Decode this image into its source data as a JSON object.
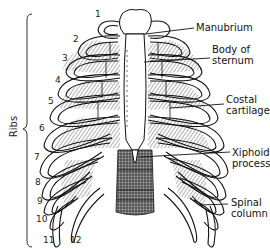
{
  "diagram": {
    "group_label": "Ribs",
    "rib_numbers": [
      "1",
      "2",
      "3",
      "4",
      "5",
      "6",
      "7",
      "8",
      "9",
      "10",
      "11",
      "12"
    ],
    "labels": {
      "manubrium": "Manubrium",
      "body_of_sternum_line1": "Body of",
      "body_of_sternum_line2": "sternum",
      "costal_cartilage_line1": "Costal",
      "costal_cartilage_line2": "cartilage",
      "xiphoid_process_line1": "Xiphoid",
      "xiphoid_process_line2": "process",
      "spinal_column_line1": "Spinal",
      "spinal_column_line2": "column"
    },
    "colors": {
      "ink": "#111111",
      "shade": "#555555",
      "background": "#ffffff"
    }
  }
}
